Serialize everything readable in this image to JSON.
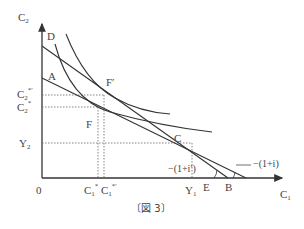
{
  "figure": {
    "caption": "〔図 3〕",
    "axes": {
      "y_label": "C",
      "y_label_sub": "2",
      "x_label": "C",
      "x_label_sub": "1",
      "origin": "0"
    },
    "y_ticks": [
      {
        "main": "C",
        "sub": "2",
        "sup": "*′",
        "id": "c2-star-prime"
      },
      {
        "main": "C",
        "sub": "2",
        "sup": "*",
        "id": "c2-star"
      },
      {
        "main": "Y",
        "sub": "2",
        "sup": "",
        "id": "y2"
      }
    ],
    "x_ticks": [
      {
        "main": "C",
        "sub": "1",
        "sup": "*",
        "id": "c1-star"
      },
      {
        "main": "C",
        "sub": "1",
        "sup": "*′",
        "id": "c1-star-prime"
      },
      {
        "main": "Y",
        "sub": "1",
        "sup": "",
        "id": "y1"
      }
    ],
    "points": {
      "D": "D",
      "A": "A",
      "F_prime": "F′",
      "F": "F",
      "C": "C",
      "E": "E",
      "B": "B"
    },
    "slope_labels": {
      "steep": "−(1+i′)",
      "shallow": "−(1+i)"
    },
    "colors": {
      "line": "#333333",
      "dotted": "#555555",
      "text": "#444444"
    }
  }
}
